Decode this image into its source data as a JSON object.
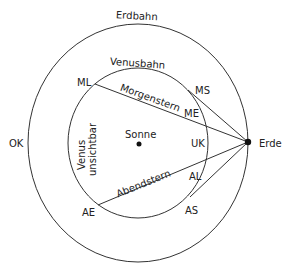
{
  "diagram": {
    "orbits": {
      "earth_label": "Erdbahn",
      "venus_label": "Venusbahn"
    },
    "bodies": {
      "sun_label": "Sonne",
      "earth_label": "Erde"
    },
    "points": {
      "ML": "ML",
      "MS": "MS",
      "ME": "ME",
      "UK": "UK",
      "AL": "AL",
      "AS": "AS",
      "AE": "AE",
      "OK": "OK"
    },
    "line_labels": {
      "morning": "Morgenstern",
      "evening": "Abendstern"
    },
    "invisible_label_line1": "Venus",
    "invisible_label_line2": "unsichtbar"
  }
}
